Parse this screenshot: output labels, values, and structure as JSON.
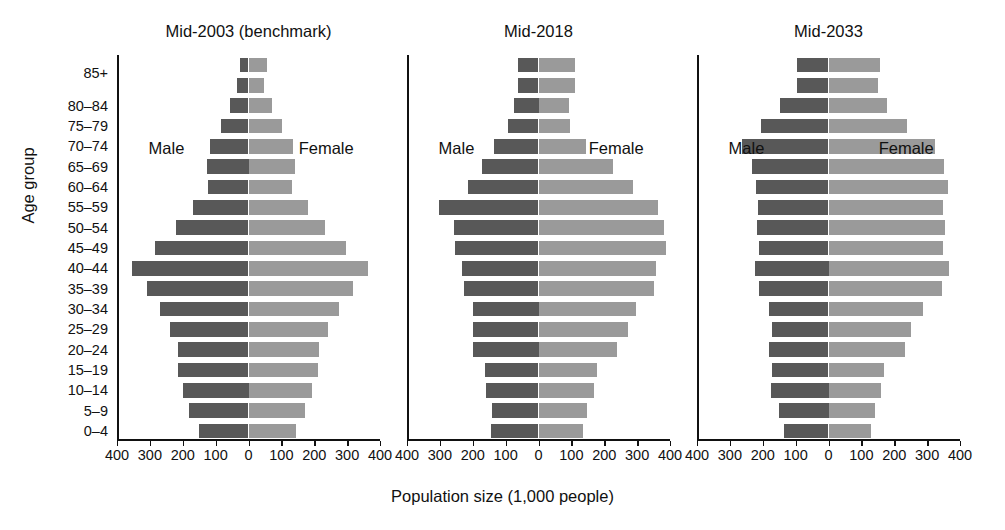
{
  "chart_data": {
    "type": "bar",
    "subtype": "population-pyramid",
    "title": "",
    "xlabel": "Population size (1,000 people)",
    "ylabel": "Age group",
    "xlim": [
      -400,
      400
    ],
    "xticks": [
      400,
      300,
      200,
      100,
      0,
      100,
      200,
      300,
      400
    ],
    "xtick_labels": [
      "400",
      "300",
      "200",
      "100",
      "0",
      "100",
      "200",
      "300",
      "400"
    ],
    "grid": false,
    "legend_position": "in-panel",
    "series_names": [
      "Male",
      "Female"
    ],
    "colors": {
      "male": "#585858",
      "female": "#9a9a9a",
      "axis": "#111111",
      "background": "#ffffff"
    },
    "categories": [
      "85+",
      "",
      "80–84",
      "75–79",
      "70–74",
      "65–69",
      "60–64",
      "55–59",
      "50–54",
      "45–49",
      "40–44",
      "35–39",
      "30–34",
      "25–29",
      "20–24",
      "15–19",
      "10–14",
      "5–9",
      "0–4"
    ],
    "panels": [
      {
        "label": "Mid-2003 (benchmark)",
        "male_label": "Male",
        "female_label": "Female",
        "male": [
          27,
          36,
          55,
          85,
          118,
          125,
          122,
          168,
          222,
          285,
          354,
          308,
          268,
          238,
          213,
          215,
          200,
          181,
          152
        ],
        "female": [
          57,
          48,
          72,
          103,
          136,
          140,
          132,
          180,
          232,
          298,
          362,
          318,
          275,
          243,
          215,
          212,
          192,
          172,
          145
        ]
      },
      {
        "label": "Mid-2018",
        "male_label": "Male",
        "female_label": "Female",
        "male": [
          63,
          63,
          75,
          92,
          135,
          173,
          215,
          302,
          258,
          253,
          232,
          228,
          200,
          198,
          200,
          163,
          160,
          142,
          145
        ],
        "female": [
          112,
          110,
          92,
          95,
          143,
          228,
          288,
          362,
          382,
          388,
          358,
          350,
          298,
          272,
          240,
          178,
          168,
          148,
          135
        ]
      },
      {
        "label": "Mid-2033",
        "male_label": "Male",
        "female_label": "Female",
        "male": [
          95,
          95,
          148,
          205,
          262,
          232,
          222,
          215,
          218,
          212,
          225,
          210,
          182,
          172,
          182,
          172,
          175,
          150,
          135
        ],
        "female": [
          158,
          152,
          178,
          238,
          325,
          350,
          362,
          348,
          355,
          348,
          368,
          345,
          288,
          252,
          232,
          170,
          160,
          140,
          130
        ]
      }
    ]
  },
  "axis_caption": "Population size (1,000 people)",
  "y_caption": "Age group"
}
